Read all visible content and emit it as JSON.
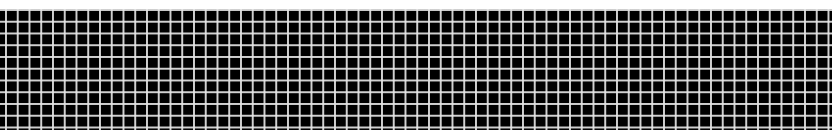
{
  "image": {
    "type": "grid-pattern",
    "description": "Black rectangle overlaid with a uniform white square grid",
    "colors": {
      "background": "#ffffff",
      "fill": "#000000",
      "grid_lines": "#e6e6e6"
    },
    "grid": {
      "cell_size_px": 11.75,
      "columns": 71,
      "rows": 10
    }
  }
}
